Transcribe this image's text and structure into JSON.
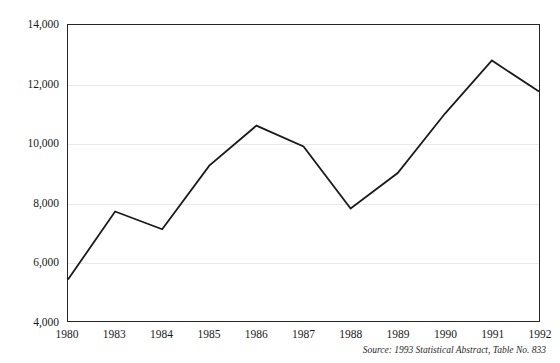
{
  "chart_data": {
    "type": "line",
    "title": "",
    "subtitle": "",
    "xlabel": "",
    "ylabel": "",
    "categories": [
      "1980",
      "1983",
      "1984",
      "1985",
      "1986",
      "1987",
      "1988",
      "1989",
      "1990",
      "1991",
      "1992"
    ],
    "values": [
      5400,
      7700,
      7100,
      9250,
      10600,
      9900,
      7800,
      9000,
      11000,
      12800,
      11750
    ],
    "series": [
      {
        "name": "",
        "values": [
          5400,
          7700,
          7100,
          9250,
          10600,
          9900,
          7800,
          9000,
          11000,
          12800,
          11750
        ],
        "color": "#1a1a1a"
      }
    ],
    "ylim": [
      4000,
      14000
    ],
    "yticks": [
      4000,
      6000,
      8000,
      10000,
      12000,
      14000
    ],
    "ytick_labels": [
      "4,000",
      "6,000",
      "8,000",
      "10,000",
      "12,000",
      "14,000"
    ],
    "xtick_labels": [
      "1980",
      "1983",
      "1984",
      "1985",
      "1986",
      "1987",
      "1988",
      "1989",
      "1990",
      "1991",
      "1992"
    ],
    "grid": true,
    "grid_axis": "y",
    "legend": false,
    "legend_position": "none",
    "line_color": "#1a1a1a",
    "line_width": 1.8,
    "markers": false,
    "plot_background": "#ffffff",
    "frame_color": "#262626",
    "gridline_color": "#e9e9e9"
  },
  "figure": {
    "source_note": "Source: 1993 Statistical Abstract, Table No. 833",
    "background": "#ffffff"
  }
}
